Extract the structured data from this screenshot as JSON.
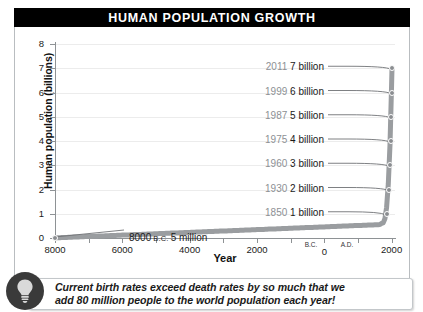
{
  "title": "HUMAN POPULATION GROWTH",
  "chart_data": {
    "type": "line",
    "title": "HUMAN POPULATION GROWTH",
    "xlabel": "Year",
    "ylabel": "Human population (billions)",
    "xlim": [
      -8000,
      2100
    ],
    "ylim": [
      0,
      8
    ],
    "grid": true,
    "legend": "none",
    "yticks": [
      "0",
      "1",
      "2",
      "3",
      "4",
      "5",
      "6",
      "7",
      "8"
    ],
    "ytick_values": [
      0,
      1,
      2,
      3,
      4,
      5,
      6,
      7,
      8
    ],
    "xticks": [
      "8000",
      "6000",
      "4000",
      "2000",
      "0",
      "2000"
    ],
    "xtick_values": [
      -8000,
      -6000,
      -4000,
      -2000,
      0,
      2000
    ],
    "era_before": "B.C.",
    "era_after": "A.D.",
    "x": [
      -8000,
      1850,
      1930,
      1960,
      1975,
      1987,
      1999,
      2011
    ],
    "y": [
      0.005,
      1,
      2,
      3,
      4,
      5,
      6,
      7
    ],
    "annotations": [
      {
        "year": "2011",
        "value": "7 billion",
        "y": 7
      },
      {
        "year": "1999",
        "value": "6 billion",
        "y": 6
      },
      {
        "year": "1987",
        "value": "5 billion",
        "y": 5
      },
      {
        "year": "1975",
        "value": "4 billion",
        "y": 4
      },
      {
        "year": "1960",
        "value": "3 billion",
        "y": 3
      },
      {
        "year": "1930",
        "value": "2 billion",
        "y": 2
      },
      {
        "year": "1850",
        "value": "1 billion",
        "y": 1
      }
    ],
    "origin_annotation": {
      "year": "8000",
      "era": "B.C.",
      "value": "5 million",
      "y": 0.005
    },
    "series_color": "#9a9da0"
  },
  "caption": {
    "line1": "Current birth rates exceed death rates by so much that we",
    "line2": "add 80 million people to the world population each year!",
    "icon": "lightbulb-icon"
  },
  "colors": {
    "title_bar": "#000000",
    "title_text": "#ffffff",
    "curve": "#9a9da0",
    "axis": "#8e9295",
    "grid": "#ececec",
    "annotation_year": "#8d9094",
    "annotation_value": "#1a1a1a",
    "badge": "#3a3a3a"
  }
}
